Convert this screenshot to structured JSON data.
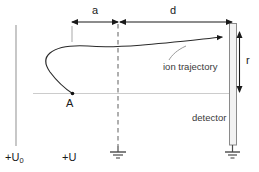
{
  "figure": {
    "width": 259,
    "height": 172,
    "background": "#ffffff",
    "stroke_dark": "#1a1a1a",
    "stroke_gray": "#b8b8b8",
    "stroke_axis": "#c8c8c8",
    "detector_fill": "#f2f2f2"
  },
  "labels": {
    "dim_a": "a",
    "dim_d": "d",
    "dim_r": "r",
    "point_a": "A",
    "ion_trajectory": "ion trajectory",
    "detector": "detector",
    "potential_u0_prefix": "+U",
    "potential_u0_sub": "0",
    "potential_u": "+U"
  },
  "elements": {
    "left_electrode": {
      "name": "left-electrode-line",
      "x": 16,
      "y1": 25,
      "y2": 146
    },
    "ground_plane_dashed": {
      "name": "dashed-ground-plane",
      "x": 118,
      "y1": 22,
      "y2": 147
    },
    "optical_axis": {
      "name": "optical-axis",
      "y": 93,
      "x1": 33,
      "x2": 229
    },
    "detector_plate": {
      "name": "detector-plate",
      "x": 229,
      "y": 23,
      "w": 7,
      "h": 122
    },
    "tick_under_a": {
      "name": "tick-mark-a-start",
      "x": 72,
      "y1": 25,
      "y2": 41
    },
    "dim_arrow_a": {
      "name": "dimension-arrow-a",
      "y": 22,
      "x1": 72,
      "x2": 118
    },
    "dim_arrow_d": {
      "name": "dimension-arrow-d",
      "y": 22,
      "x1": 119,
      "x2": 232
    },
    "dim_arrow_r": {
      "name": "dimension-arrow-r",
      "x": 239,
      "y1": 32,
      "y2": 92
    },
    "ground_symbol_center": {
      "name": "ground-symbol-center",
      "x": 118,
      "y": 150
    },
    "ground_symbol_right": {
      "name": "ground-symbol-right",
      "x": 232,
      "y": 150
    },
    "trajectory_start_point": {
      "name": "trajectory-start-point-a",
      "x": 72,
      "y": 93
    },
    "trajectory_end_point": {
      "name": "trajectory-end-arrow",
      "x": 228,
      "y": 37
    }
  }
}
